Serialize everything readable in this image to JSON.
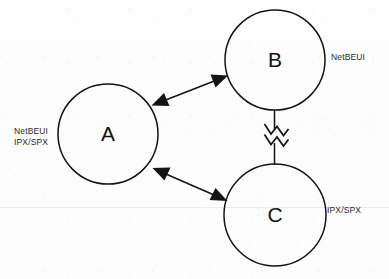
{
  "diagram": {
    "type": "node-link-diagram",
    "background_color": "#fdfdfd",
    "stroke_color": "#141414",
    "canvas": {
      "width": 389,
      "height": 279
    },
    "nodes": [
      {
        "id": "A",
        "label": "A",
        "cx": 108,
        "cy": 134,
        "r": 50,
        "protocols": [
          "NetBEUI",
          "IPX/SPX"
        ],
        "protocol_label_line1": "NetBEUI",
        "protocol_label_line2": "IPX/SPX"
      },
      {
        "id": "B",
        "label": "B",
        "cx": 275,
        "cy": 60,
        "r": 50,
        "protocols": [
          "NetBEUI"
        ],
        "protocol_label_line1": "NetBEUI",
        "protocol_label_line2": ""
      },
      {
        "id": "C",
        "label": "C",
        "cx": 275,
        "cy": 215,
        "r": 51,
        "protocols": [
          "IPX/SPX"
        ],
        "protocol_label_line1": "IPX/SPX",
        "protocol_label_line2": ""
      }
    ],
    "links": [
      {
        "id": "a-b",
        "from": "A",
        "to": "B",
        "style": "double-headed-arrow",
        "label": ""
      },
      {
        "id": "a-c",
        "from": "A",
        "to": "C",
        "style": "double-headed-arrow",
        "label": ""
      },
      {
        "id": "b-c",
        "from": "B",
        "to": "C",
        "style": "zigzag-break-line",
        "label": ""
      }
    ]
  }
}
